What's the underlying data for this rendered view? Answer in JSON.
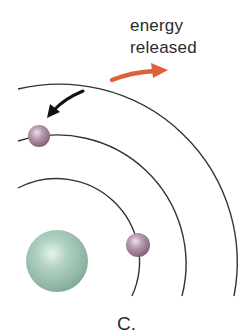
{
  "diagram": {
    "annotation": {
      "line1": "energy",
      "line2": "released"
    },
    "panel_label": "C.",
    "elements": {
      "nucleus": "nucleus",
      "orbits": [
        "inner-orbit",
        "middle-orbit",
        "outer-orbit"
      ],
      "electrons": [
        "electron-inner-orbit",
        "electron-middle-orbit"
      ],
      "arrows": [
        "electron-transition-arrow",
        "energy-release-arrow"
      ]
    },
    "colors": {
      "orbit_line": "#333333",
      "nucleus": "#9cc2b0",
      "electron": "#a8889c",
      "transition_arrow": "#111111",
      "energy_arrow": "#e0603a",
      "text": "#2b2b2b"
    }
  }
}
